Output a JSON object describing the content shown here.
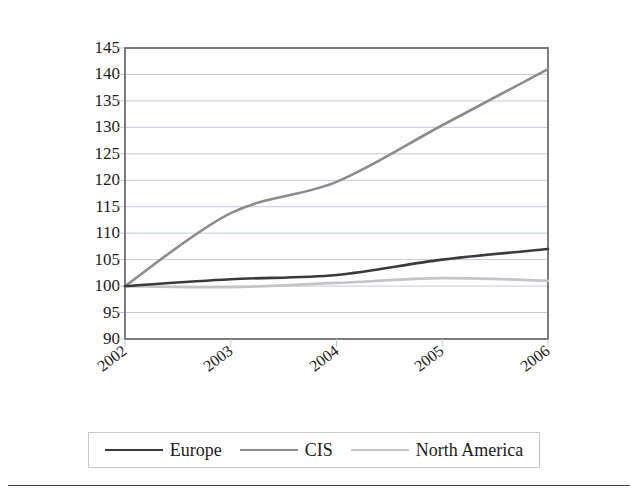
{
  "chart_data": {
    "type": "line",
    "title": "",
    "xlabel": "",
    "ylabel": "Index (2002=100)",
    "x": [
      2002,
      2003,
      2004,
      2005,
      2006
    ],
    "categories": [
      "2002",
      "2003",
      "2004",
      "2005",
      "2006"
    ],
    "ylim": [
      90,
      145
    ],
    "ytick_step": 5,
    "yticks": [
      145,
      140,
      135,
      130,
      125,
      120,
      115,
      110,
      105,
      100,
      95,
      90
    ],
    "xticks": [
      "2002",
      "2003",
      "2004",
      "2005",
      "2006"
    ],
    "grid": "horizontal",
    "legend_position": "bottom",
    "series": [
      {
        "name": "Europe",
        "color": "#3a3a3a",
        "width": 2.6,
        "values": [
          100.0,
          101.3,
          102.1,
          105.0,
          107.0
        ]
      },
      {
        "name": "CIS",
        "color": "#8c8c8c",
        "width": 2.6,
        "values": [
          100.0,
          113.8,
          119.7,
          130.4,
          141.0
        ]
      },
      {
        "name": "North America",
        "color": "#c4c4c4",
        "width": 2.6,
        "values": [
          100.0,
          99.8,
          100.6,
          101.5,
          101.0
        ]
      }
    ]
  },
  "axis": {
    "y_label": "Index (2002=100)"
  },
  "legend": {
    "items": [
      {
        "label": "Europe",
        "color": "#3a3a3a"
      },
      {
        "label": "CIS",
        "color": "#8c8c8c"
      },
      {
        "label": "North America",
        "color": "#c4c4c4"
      }
    ]
  },
  "caption": {
    "text": ""
  },
  "colors": {
    "plot_border": "#6e6e6e",
    "gridline": "#c3cbd6",
    "background": "#ffffff",
    "rule": "#4a4a4a"
  }
}
